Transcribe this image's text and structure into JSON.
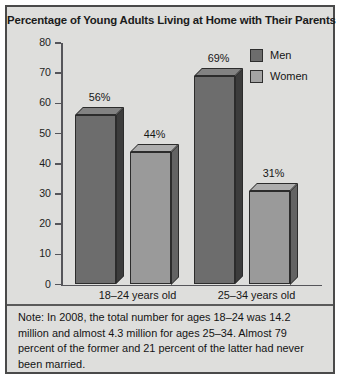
{
  "figure": {
    "title": "Percentage of Young Adults Living at Home with Their Parents",
    "note": "Note: In 2008, the total number for ages 18–24 was 14.2 million and almost 4.3 million for ages 25–34. Almost 79 percent of the former and 21 percent of the latter had never been married."
  },
  "colors": {
    "men": "#6d6d6d",
    "women": "#9a9a9a",
    "background": "#dededc",
    "border": "#4a4a4a",
    "axis": "#55555a"
  },
  "legend": {
    "items": [
      {
        "label": "Men",
        "key": "men"
      },
      {
        "label": "Women",
        "key": "women"
      }
    ]
  },
  "chart_data": {
    "type": "bar",
    "title": "Percentage of Young Adults Living at Home with Their Parents",
    "xlabel": "",
    "ylabel": "",
    "ylim": [
      0,
      80
    ],
    "yticks": [
      0,
      10,
      20,
      30,
      40,
      50,
      60,
      70,
      80
    ],
    "ytick_labels": [
      "0",
      "10",
      "20",
      "30",
      "40",
      "50",
      "60",
      "70",
      "80"
    ],
    "grid": false,
    "legend_position": "top-right",
    "categories": [
      "18–24 years old",
      "25–34 years old"
    ],
    "series": [
      {
        "name": "Men",
        "color": "#6d6d6d",
        "values": [
          56,
          69
        ],
        "labels": [
          "56%",
          "69%"
        ]
      },
      {
        "name": "Women",
        "color": "#9a9a9a",
        "values": [
          44,
          31
        ],
        "labels": [
          "44%",
          "31%"
        ]
      }
    ]
  }
}
